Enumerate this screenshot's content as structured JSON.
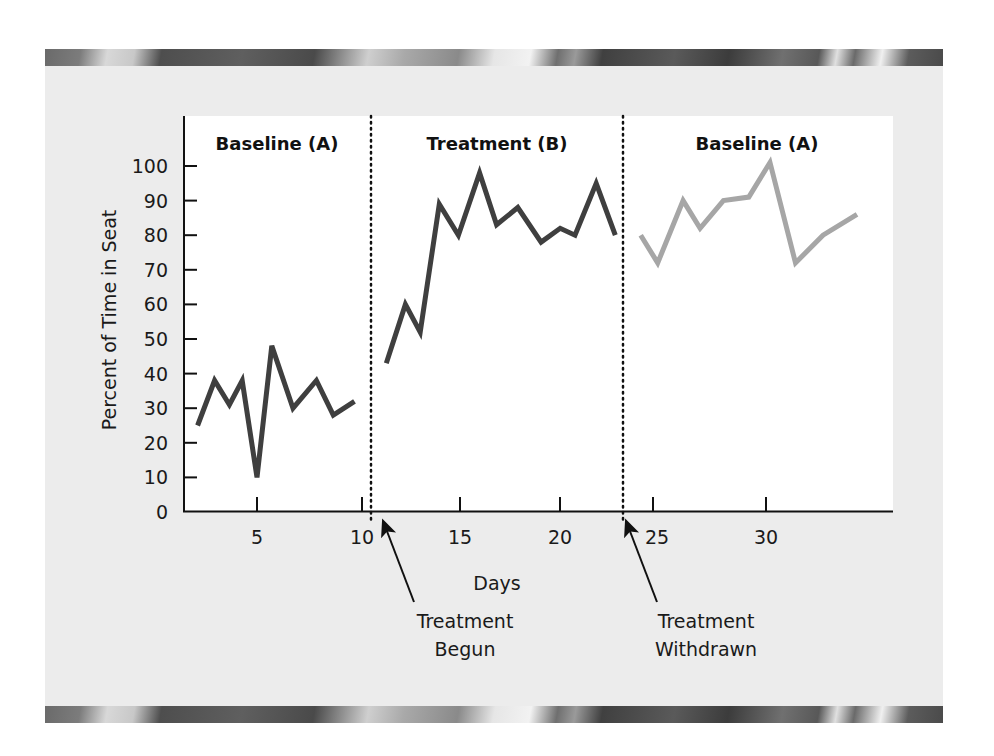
{
  "chart_data": {
    "type": "line",
    "title": "",
    "xlabel": "Days",
    "ylabel": "Percent of Time in Seat",
    "xlim": [
      1.5,
      35
    ],
    "ylim": [
      0,
      100
    ],
    "x_ticks": [
      5,
      10,
      15,
      20,
      25,
      30
    ],
    "y_ticks": [
      0,
      10,
      20,
      30,
      40,
      50,
      60,
      70,
      80,
      90,
      100
    ],
    "grid": false,
    "legend": null,
    "phase_labels": [
      "Baseline (A)",
      "Treatment (B)",
      "Baseline (A)"
    ],
    "phase_boundaries": [
      10.4,
      22.3
    ],
    "annotations": [
      {
        "text_line1": "Treatment",
        "text_line2": "Begun",
        "points_to_day": 10.9
      },
      {
        "text_line1": "Treatment",
        "text_line2": "Withdrawn",
        "points_to_day": 22.4
      }
    ],
    "series": [
      {
        "name": "Baseline (A)",
        "color": "#3f3f3f",
        "x": [
          2.2,
          3.0,
          3.7,
          4.3,
          5.0,
          5.7,
          6.7,
          7.8,
          8.6,
          9.6
        ],
        "values": [
          25,
          38,
          31,
          38,
          10,
          48,
          30,
          38,
          28,
          32
        ]
      },
      {
        "name": "Treatment (B)",
        "color": "#3f3f3f",
        "x": [
          11.1,
          12.0,
          12.7,
          13.6,
          14.5,
          15.5,
          16.3,
          17.3,
          18.4,
          19.3,
          20.0,
          21.0,
          21.9
        ],
        "values": [
          43,
          60,
          52,
          89,
          80,
          98,
          83,
          88,
          78,
          82,
          80,
          95,
          80
        ]
      },
      {
        "name": "Baseline (A) return",
        "color": "#a6a6a6",
        "x": [
          23.1,
          23.9,
          25.1,
          25.9,
          27.0,
          28.2,
          29.2,
          30.4,
          31.7,
          33.3
        ],
        "values": [
          80,
          72,
          90,
          82,
          90,
          91,
          101,
          72,
          80,
          86
        ]
      }
    ]
  },
  "labels": {
    "ylabel": "Percent of Time in Seat",
    "xlabel": "Days",
    "phase1": "Baseline (A)",
    "phase2": "Treatment (B)",
    "phase3": "Baseline (A)",
    "annot1_line1": "Treatment",
    "annot1_line2": "Begun",
    "annot2_line1": "Treatment",
    "annot2_line2": "Withdrawn",
    "y_ticks": [
      "0",
      "10",
      "20",
      "30",
      "40",
      "50",
      "60",
      "70",
      "80",
      "90",
      "100"
    ],
    "x_ticks": [
      "5",
      "10",
      "15",
      "20",
      "25",
      "30"
    ]
  }
}
